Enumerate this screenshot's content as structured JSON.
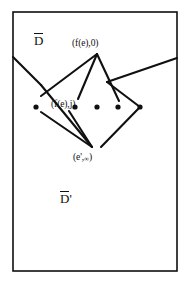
{
  "figure": {
    "title_region_upper": "D̄",
    "title_region_lower": "D̄'",
    "labels": {
      "region_upper": "D",
      "region_lower": "D",
      "region_lower_prime": "'",
      "vertex_top": "(f(e),0)",
      "vertex_middle": "(f(e),j)",
      "vertex_bottom_base": "(e'",
      "vertex_bottom_sep": ",",
      "vertex_bottom_inf": "∞",
      "vertex_bottom_close": ")"
    },
    "colors": {
      "ink": "#101010",
      "background": "#ffffff",
      "border": "#101010"
    },
    "border": {
      "x": 13,
      "y": 12,
      "width": 164,
      "height": 259,
      "stroke_width": 1.6
    },
    "dots": [
      {
        "name": "dot-1",
        "cx": 36,
        "cy": 107,
        "r": 2.6
      },
      {
        "name": "dot-2",
        "cx": 75,
        "cy": 107,
        "r": 2.6
      },
      {
        "name": "dot-3",
        "cx": 97,
        "cy": 107,
        "r": 2.6
      },
      {
        "name": "dot-4",
        "cx": 118,
        "cy": 107,
        "r": 2.6
      },
      {
        "name": "dot-5",
        "cx": 140,
        "cy": 107,
        "r": 2.6
      }
    ],
    "edges": [
      {
        "name": "edge-left-border-to-bend",
        "points": "13,57 41,85"
      },
      {
        "name": "edge-bend-to-bottom-vertex",
        "points": "41,85 92,147"
      },
      {
        "name": "edge-right-border-to-bend",
        "points": "177,58 107,82"
      },
      {
        "name": "edge-right-bend-to-dot5",
        "points": "107,82 140,107"
      },
      {
        "name": "edge-apex-to-leftcross",
        "points": "97,54 41,96"
      },
      {
        "name": "edge-apex-to-midvertex",
        "points": "97,54 78,99"
      },
      {
        "name": "edge-apex-to-rightdown",
        "points": "97,54 119,101"
      },
      {
        "name": "edge-mid-to-bottom-vertex",
        "points": "69,111 92,147"
      },
      {
        "name": "edge-dot5-to-bottom-vertex",
        "points": "140,107 101,147"
      },
      {
        "name": "edge-leftdot-to-bottom",
        "points": "41,112 92,147"
      }
    ]
  }
}
